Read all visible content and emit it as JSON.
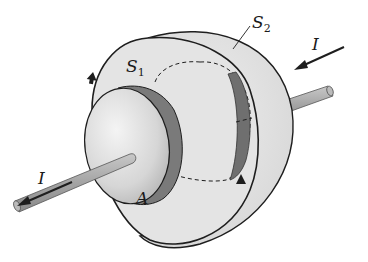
{
  "diagram": {
    "labels": {
      "s1": {
        "main": "S",
        "sub": "1"
      },
      "s2": {
        "main": "S",
        "sub": "2"
      },
      "plate_area": "A",
      "current_in": "I",
      "current_out": "I"
    },
    "colors": {
      "background": "#ffffff",
      "outline": "#1e1e1e",
      "surface_fill": "#e2e2e2",
      "plate_face": "#d9d9d9",
      "plate_edge": "#7a7a7a",
      "wire": "#a8a8a8"
    }
  }
}
